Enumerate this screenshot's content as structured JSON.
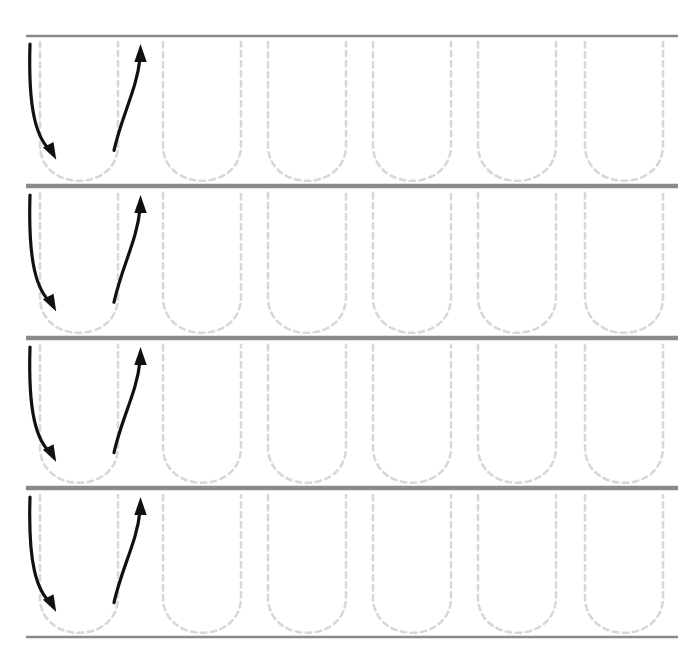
{
  "worksheet": {
    "title": "Letter U Tracing Practice",
    "letter": "U",
    "letter_case": "uppercase",
    "rows_count": 4,
    "glyphs_per_row": 6,
    "guided_glyphs_per_row": 1,
    "canvas": {
      "width": 696,
      "height": 647
    },
    "colors": {
      "background": "#ffffff",
      "rule_line": "#8a8a8a",
      "trace_dash": "#d8d8d8",
      "stroke_arrow": "#111111"
    },
    "rule_lines": {
      "x_start": 26,
      "x_end": 678,
      "thickness": 2.4,
      "y_positions": [
        36,
        185,
        187,
        337,
        339,
        487,
        489,
        637
      ],
      "label": "ruled writing guideline"
    },
    "rows": [
      {
        "index": 1,
        "name": "practice-row-1",
        "top_line_y": 36,
        "baseline_y": 185,
        "has_direction_arrows": true
      },
      {
        "index": 2,
        "name": "practice-row-2",
        "top_line_y": 187,
        "baseline_y": 337,
        "has_direction_arrows": true
      },
      {
        "index": 3,
        "name": "practice-row-3",
        "top_line_y": 339,
        "baseline_y": 487,
        "has_direction_arrows": true
      },
      {
        "index": 4,
        "name": "practice-row-4",
        "top_line_y": 489,
        "baseline_y": 637,
        "has_direction_arrows": true
      }
    ],
    "glyph_geometry": {
      "left_x_positions": [
        40,
        163,
        268,
        373,
        478,
        585
      ],
      "width": 78,
      "period": 105,
      "bowl_depth_ratio": 0.42,
      "dash_length": 5.5,
      "dash_gap": 4.5,
      "stroke_width": 2.6,
      "description": "dashed uppercase U outline: two vertical sides joined by a rounded bowl at the baseline"
    },
    "direction_arrows": {
      "count_per_row": 2,
      "stroke_width": 3.2,
      "items": [
        {
          "order": 1,
          "name": "stroke-1-down-arrow",
          "direction": "down",
          "description": "start at top left, curve down and round toward the bowl",
          "start": {
            "x": 30,
            "y": 44
          },
          "end": {
            "x": 50,
            "y": 160
          },
          "arrowhead_angle_deg": 58
        },
        {
          "order": 2,
          "name": "stroke-2-up-arrow",
          "direction": "up",
          "description": "start near the bowl on the right, sweep up to the top line",
          "start": {
            "x": 114,
            "y": 158
          },
          "end": {
            "x": 140,
            "y": 46
          },
          "arrowhead_angle_deg": 0
        }
      ]
    }
  }
}
